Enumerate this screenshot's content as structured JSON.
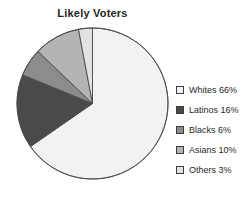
{
  "chart_data": {
    "type": "pie",
    "title": "Likely Voters",
    "categories": [
      "Whites",
      "Latinos",
      "Blacks",
      "Asians",
      "Others"
    ],
    "values": [
      66,
      16,
      6,
      10,
      3
    ],
    "unit": "%",
    "start_angle_deg": 0,
    "direction": "clockwise",
    "legend_position": "right",
    "grid": false,
    "xlabel": "",
    "ylabel": "",
    "slices": [
      {
        "label": "Whites",
        "value": 66,
        "legend_text": "Whites 66%",
        "color": "#f2f2f2"
      },
      {
        "label": "Latinos",
        "value": 16,
        "legend_text": "Latinos 16%",
        "color": "#4a4a4a"
      },
      {
        "label": "Blacks",
        "value": 6,
        "legend_text": "Blacks 6%",
        "color": "#8c8c8c"
      },
      {
        "label": "Asians",
        "value": 10,
        "legend_text": "Asians 10%",
        "color": "#b4b4b4"
      },
      {
        "label": "Others",
        "value": 3,
        "legend_text": "Others 3%",
        "color": "#e2e2e2"
      }
    ],
    "stroke_color": "#4a4a4a"
  }
}
